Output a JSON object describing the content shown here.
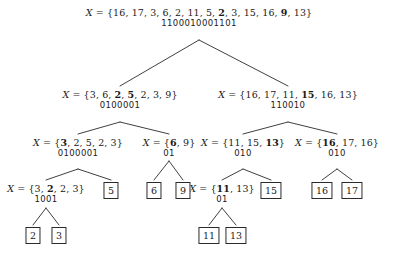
{
  "figure": {
    "name": "recursion-tree-with-bitstrings",
    "variable": "X",
    "equals": "=",
    "open_brace": "{",
    "close_brace": "}",
    "separator": ", "
  },
  "nodes": {
    "root": {
      "elements": [
        "16",
        "17",
        "3",
        "6",
        "2",
        "11",
        "5",
        "2",
        "3",
        "15",
        "16",
        "9",
        "13"
      ],
      "bold_indices": [
        7,
        11
      ],
      "bitstring": "1100010001101"
    },
    "l1_left": {
      "elements": [
        "3",
        "6",
        "2",
        "5",
        "2",
        "3",
        "9"
      ],
      "bold_indices": [
        2,
        3
      ],
      "bitstring": "0100001"
    },
    "l1_right": {
      "elements": [
        "16",
        "17",
        "11",
        "15",
        "16",
        "13"
      ],
      "bold_indices": [
        3
      ],
      "bitstring": "110010"
    },
    "l2_a": {
      "elements": [
        "3",
        "2",
        "5",
        "2",
        "3"
      ],
      "bold_indices": [
        0
      ],
      "bitstring": "0100001"
    },
    "l2_b": {
      "elements": [
        "6",
        "9"
      ],
      "bold_indices": [
        0
      ],
      "bitstring": "01"
    },
    "l2_c": {
      "elements": [
        "11",
        "15",
        "13"
      ],
      "bold_indices": [
        2
      ],
      "bitstring": "010"
    },
    "l2_d": {
      "elements": [
        "16",
        "17",
        "16"
      ],
      "bold_indices": [
        0
      ],
      "bitstring": "010"
    },
    "l3_a": {
      "elements": [
        "3",
        "2",
        "2",
        "3"
      ],
      "bold_indices": [
        1
      ],
      "bitstring": "1001"
    },
    "l3_c": {
      "elements": [
        "11",
        "13"
      ],
      "bold_indices": [
        0
      ],
      "bitstring": "01"
    }
  },
  "leaves": {
    "leaf_5": "5",
    "leaf_6": "6",
    "leaf_9": "9",
    "leaf_15": "15",
    "leaf_16": "16",
    "leaf_17": "17",
    "leaf_2": "2",
    "leaf_3": "3",
    "leaf_11": "11",
    "leaf_13": "13"
  }
}
